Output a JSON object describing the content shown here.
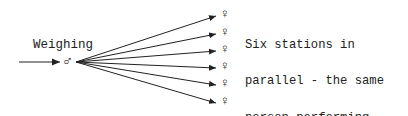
{
  "diagram": {
    "source_label": "Weighing",
    "source_symbol": "♂",
    "station_symbol": "♀",
    "station_count": 6,
    "description_lines": [
      "Six stations in",
      "parallel - the same",
      "person performing",
      "multiple functions,",
      "but there is time to",
      "establish contact",
      "and guidance."
    ]
  }
}
